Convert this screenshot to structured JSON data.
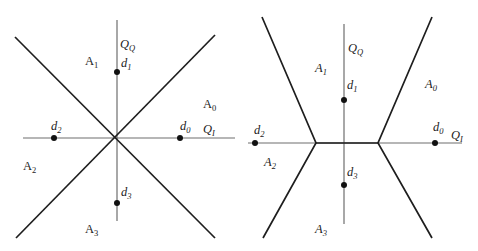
{
  "figure": {
    "left": {
      "axes": {
        "horizontal": "QI",
        "vertical": "QQ"
      },
      "points": [
        {
          "name": "d0",
          "sub": "0"
        },
        {
          "name": "d1",
          "sub": "1"
        },
        {
          "name": "d2",
          "sub": "2"
        },
        {
          "name": "d3",
          "sub": "3"
        }
      ],
      "regions": [
        {
          "name": "A0",
          "sub": "0"
        },
        {
          "name": "A1",
          "sub": "1"
        },
        {
          "name": "A2",
          "sub": "2"
        },
        {
          "name": "A3",
          "sub": "3"
        }
      ],
      "labels": {
        "qq_main": "Q",
        "qq_sub": "Q",
        "qi_main": "Q",
        "qi_sub": "I",
        "d_main": "d",
        "a_main": "A"
      }
    },
    "right": {
      "axes": {
        "horizontal": "QI",
        "vertical": "QQ"
      },
      "labels": {
        "qq_main": "Q",
        "qq_sub": "Q",
        "qi_main": "Q",
        "qi_sub": "I",
        "d_main": "d",
        "a_main": "A"
      }
    },
    "colors": {
      "axis": "#6e6e6e",
      "boundary": "#1e1e1e",
      "point": "#111111",
      "text": "#222222"
    }
  }
}
